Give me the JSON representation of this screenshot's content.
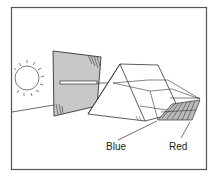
{
  "diagram": {
    "labels": {
      "blue": "Blue",
      "red": "Red"
    },
    "elements": [
      "sun",
      "screen-with-slit",
      "light-beam",
      "prism",
      "spectrum"
    ],
    "colors": {
      "line": "#333333",
      "screen_fill": "#c8c8c8",
      "background": "#ffffff",
      "frame": "#555555"
    }
  }
}
